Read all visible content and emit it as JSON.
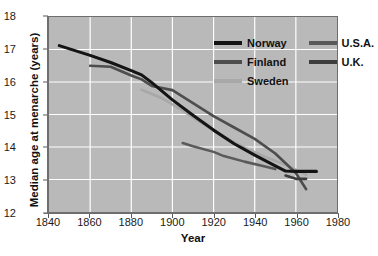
{
  "chart_data": {
    "type": "line",
    "title": "",
    "xlabel": "Year",
    "ylabel": "Median age at menarche (years)",
    "xlim": [
      1840,
      1980
    ],
    "ylim": [
      12,
      18
    ],
    "xticks": [
      1840,
      1860,
      1880,
      1900,
      1920,
      1940,
      1960,
      1980
    ],
    "yticks": [
      12,
      13,
      14,
      15,
      16,
      17,
      18
    ],
    "grid": true,
    "legend_position": "top-right-inside",
    "plot_background": "#b9b9b9",
    "gridline_color": "#ffffff",
    "series": [
      {
        "name": "Norway",
        "color": "#141414",
        "points": [
          [
            1845,
            17.12
          ],
          [
            1860,
            16.82
          ],
          [
            1870,
            16.6
          ],
          [
            1880,
            16.35
          ],
          [
            1885,
            16.22
          ],
          [
            1890,
            15.98
          ],
          [
            1900,
            15.45
          ],
          [
            1910,
            14.98
          ],
          [
            1920,
            14.52
          ],
          [
            1930,
            14.1
          ],
          [
            1940,
            13.75
          ],
          [
            1950,
            13.42
          ],
          [
            1955,
            13.26
          ],
          [
            1960,
            13.25
          ],
          [
            1970,
            13.25
          ]
        ]
      },
      {
        "name": "Finland",
        "color": "#4d4d4d",
        "points": [
          [
            1860,
            16.5
          ],
          [
            1870,
            16.47
          ],
          [
            1880,
            16.2
          ],
          [
            1885,
            16.08
          ],
          [
            1890,
            15.88
          ],
          [
            1900,
            15.75
          ],
          [
            1910,
            15.35
          ],
          [
            1920,
            14.95
          ],
          [
            1930,
            14.6
          ],
          [
            1940,
            14.25
          ],
          [
            1950,
            13.8
          ],
          [
            1960,
            13.2
          ],
          [
            1965,
            12.7
          ]
        ]
      },
      {
        "name": "Sweden",
        "color": "#a8a8a8",
        "points": [
          [
            1885,
            15.76
          ],
          [
            1895,
            15.5
          ],
          [
            1905,
            15.12
          ],
          [
            1915,
            14.7
          ],
          [
            1925,
            14.32
          ],
          [
            1935,
            13.98
          ],
          [
            1945,
            13.7
          ],
          [
            1955,
            13.45
          ],
          [
            1965,
            13.15
          ]
        ]
      },
      {
        "name": "U.S.A.",
        "color": "#5a5a5a",
        "points": [
          [
            1905,
            14.12
          ],
          [
            1910,
            14.02
          ],
          [
            1920,
            13.85
          ],
          [
            1925,
            13.72
          ],
          [
            1935,
            13.55
          ],
          [
            1945,
            13.4
          ],
          [
            1950,
            13.32
          ]
        ]
      },
      {
        "name": "U.K.",
        "color": "#3d3d3d",
        "points": [
          [
            1955,
            13.12
          ],
          [
            1960,
            13.02
          ],
          [
            1965,
            13.02
          ]
        ]
      }
    ]
  },
  "axes": {
    "y_title": "Median age at menarche (years)",
    "x_title": "Year",
    "y_tick_labels": [
      "18",
      "17",
      "16",
      "15",
      "14",
      "13",
      "12"
    ],
    "x_tick_labels": [
      "1840",
      "1860",
      "1880",
      "1900",
      "1920",
      "1940",
      "1960",
      "1980"
    ]
  },
  "legend": {
    "entries": [
      {
        "label": "Norway",
        "color": "#141414"
      },
      {
        "label": "U.S.A.",
        "color": "#5a5a5a"
      },
      {
        "label": "Finland",
        "color": "#4d4d4d"
      },
      {
        "label": "U.K.",
        "color": "#3d3d3d"
      },
      {
        "label": "Sweden",
        "color": "#a8a8a8"
      }
    ]
  }
}
